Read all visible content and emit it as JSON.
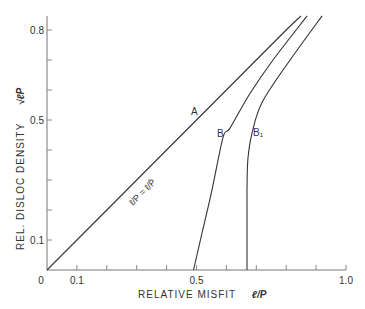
{
  "chart_data": {
    "type": "line",
    "title": "",
    "xlabel": "RELATIVE MISFIT",
    "xlabel_symbol": "ℓ/P",
    "ylabel": "REL. DISLOC DENSITY",
    "ylabel_symbol": "√ℓP",
    "xlim": [
      0,
      1.0
    ],
    "ylim": [
      0,
      0.85
    ],
    "x_tick_labels": [
      {
        "value": 0,
        "label": "0"
      },
      {
        "value": 0.1,
        "label": "0.1"
      },
      {
        "value": 0.5,
        "label": "0.5"
      },
      {
        "value": 1.0,
        "label": "1.0"
      }
    ],
    "x_minor_ticks": [
      0.1,
      0.2,
      0.3,
      0.4,
      0.5,
      0.6,
      0.7,
      0.8,
      0.9,
      1.0
    ],
    "y_tick_labels": [
      {
        "value": 0.1,
        "label": "0.1"
      },
      {
        "value": 0.5,
        "label": "0.5"
      },
      {
        "value": 0.8,
        "label": "0.8"
      }
    ],
    "y_minor_ticks": [
      0.1,
      0.2,
      0.3,
      0.4,
      0.5,
      0.6,
      0.7,
      0.8
    ],
    "grid": false,
    "legend": "none (curves labeled inline)",
    "series": [
      {
        "name": "A",
        "annotation": "ℓ/P = ℓ/P̄",
        "x": [
          0.0,
          0.2,
          0.4,
          0.6,
          0.8,
          0.85
        ],
        "y": [
          0.0,
          0.2,
          0.4,
          0.6,
          0.8,
          0.847
        ]
      },
      {
        "name": "B",
        "x": [
          0.49,
          0.52,
          0.552,
          0.589,
          0.612,
          0.68,
          0.756,
          0.87
        ],
        "y": [
          0.0,
          0.13,
          0.267,
          0.443,
          0.473,
          0.59,
          0.7,
          0.847
        ]
      },
      {
        "name": "B₁",
        "x": [
          0.669,
          0.669,
          0.669,
          0.672,
          0.686,
          0.72,
          0.813,
          0.92
        ],
        "y": [
          0.0,
          0.15,
          0.267,
          0.37,
          0.457,
          0.56,
          0.7,
          0.847
        ]
      }
    ],
    "labels": {
      "A": "A",
      "B": "B",
      "B1": "B₁",
      "diag": "ℓ/P  =  ℓ/P̄"
    }
  }
}
